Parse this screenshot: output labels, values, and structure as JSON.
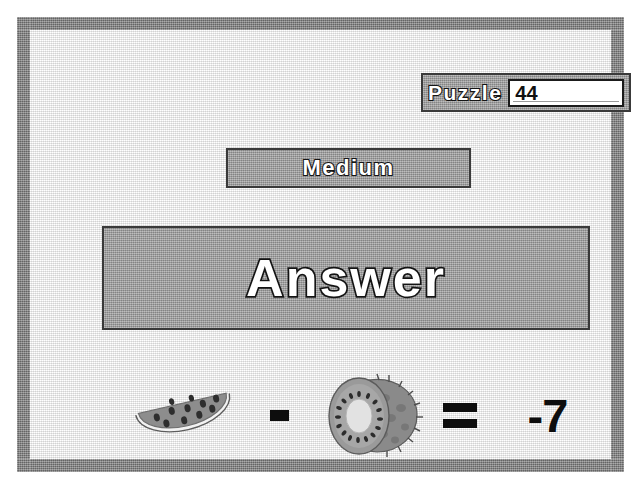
{
  "window": {
    "background_color": "#ffffff",
    "frame_color": "#7a7a7a",
    "panel_color": "#9c9c9c"
  },
  "header": {
    "puzzle_label": "Puzzle",
    "puzzle_number": "44",
    "puzzle_number_placeholder": "44"
  },
  "difficulty": {
    "label": "Medium"
  },
  "banner": {
    "title": "Answer"
  },
  "equation": {
    "left_operand": {
      "icon": "watermelon-slice-icon",
      "name": "watermelon"
    },
    "operator": {
      "icon": "minus-sign-icon",
      "symbol": "-"
    },
    "right_operand": {
      "icon": "kiwi-fruit-icon",
      "name": "kiwi"
    },
    "equals": {
      "icon": "equals-sign-icon",
      "symbol": "="
    },
    "result": "-7",
    "expression": "watermelon - kiwi = -7"
  }
}
